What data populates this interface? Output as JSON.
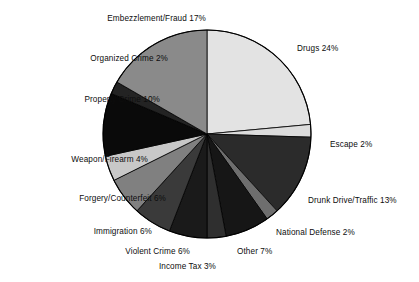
{
  "chart_data": {
    "type": "pie",
    "title": "",
    "subtitle": "",
    "xlabel": "",
    "ylabel": "",
    "legend_position": "none",
    "grid": false,
    "labels_show_percent": true,
    "start_angle_deg": 0,
    "direction": "clockwise",
    "categories": [
      "Drugs",
      "Escape",
      "Drunk Drive/Traffic",
      "National Defense",
      "Other",
      "Income Tax",
      "Violent Crime",
      "Immigration",
      "Forgery/Counterfeit",
      "Weapon/Firearm",
      "Property Crime",
      "Organized Crime",
      "Embezzlement/Fraud"
    ],
    "values": [
      24,
      2,
      13,
      2,
      7,
      3,
      6,
      6,
      6,
      4,
      10,
      2,
      17
    ],
    "units": "percent",
    "total": 102,
    "slices": [
      {
        "label": "Drugs 24%",
        "name": "Drugs",
        "value": 24,
        "color": "#e3e3e3",
        "label_side": "right"
      },
      {
        "label": "Escape 2%",
        "name": "Escape",
        "value": 2,
        "color": "#dcdcdc",
        "label_side": "right"
      },
      {
        "label": "Drunk Drive/Traffic 13%",
        "name": "Drunk Drive/Traffic",
        "value": 13,
        "color": "#2b2b2b",
        "label_side": "right"
      },
      {
        "label": "National Defense 2%",
        "name": "National Defense",
        "value": 2,
        "color": "#6e6e6e",
        "label_side": "right"
      },
      {
        "label": "Other 7%",
        "name": "Other",
        "value": 7,
        "color": "#161616",
        "label_side": "right"
      },
      {
        "label": "Income Tax 3%",
        "name": "Income Tax",
        "value": 3,
        "color": "#2f2f2f",
        "label_side": "left"
      },
      {
        "label": "Violent Crime 6%",
        "name": "Violent Crime",
        "value": 6,
        "color": "#1a1a1a",
        "label_side": "left"
      },
      {
        "label": "Immigration 6%",
        "name": "Immigration",
        "value": 6,
        "color": "#3a3a3a",
        "label_side": "left"
      },
      {
        "label": "Forgery/Counterfeit 6%",
        "name": "Forgery/Counterfeit",
        "value": 6,
        "color": "#808080",
        "label_side": "left"
      },
      {
        "label": "Weapon/Firearm 4%",
        "name": "Weapon/Firearm",
        "value": 4,
        "color": "#c8c8c8",
        "label_side": "left"
      },
      {
        "label": "Property Crime 10%",
        "name": "Property Crime",
        "value": 10,
        "color": "#0a0a0a",
        "label_side": "left"
      },
      {
        "label": "Organized Crime 2%",
        "name": "Organized Crime",
        "value": 2,
        "color": "#232323",
        "label_side": "left"
      },
      {
        "label": "Embezzlement/Fraud 17%",
        "name": "Embezzlement/Fraud",
        "value": 17,
        "color": "#8a8a8a",
        "label_side": "left"
      }
    ],
    "geometry": {
      "center_x": 207,
      "center_y": 134,
      "radius": 104
    },
    "background_color": "#ffffff",
    "outline_color": "#000000"
  }
}
